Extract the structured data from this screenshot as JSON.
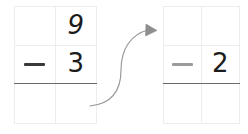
{
  "worksheet": {
    "title": "Vertical subtraction rewrite",
    "description": "A two-by-three place-value grid showing 9 minus 3, connected by a curved arrow to a second grid showing a blank minuend over minus 2."
  },
  "colors": {
    "grid_line": "#eceded",
    "answer_rule": "#6a6a6a",
    "digit_ink": "#1b1b1b",
    "operator_dark": "#3a3a3a",
    "operator_light": "#9b9b9b",
    "arrow": "#9a9a9a",
    "background": "#ffffff"
  },
  "problem_left": {
    "name": "subtraction-grid-left",
    "rows": [
      {
        "tens": "",
        "ones": "9"
      },
      {
        "tens": "−",
        "ones": "3"
      },
      {
        "tens": "",
        "ones": ""
      }
    ],
    "minuend": "9",
    "subtrahend": "3",
    "operator": "−",
    "answer": ""
  },
  "problem_right": {
    "name": "subtraction-grid-right",
    "rows": [
      {
        "tens": "",
        "ones": ""
      },
      {
        "tens": "−",
        "ones": "2"
      },
      {
        "tens": "",
        "ones": ""
      }
    ],
    "minuend": "",
    "subtrahend": "2",
    "operator": "−",
    "answer": ""
  },
  "connector": {
    "name": "curved-arrow",
    "icon": "curved-arrow-right-icon",
    "direction": "left-to-right",
    "label": ""
  }
}
